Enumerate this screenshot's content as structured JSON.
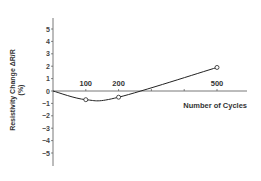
{
  "chart_data": {
    "type": "line",
    "title": "",
    "xlabel": "Number of Cycles",
    "ylabel": "Resistivity Change ΔR/R",
    "ylabel_unit": "(%)",
    "x_ticks": [
      100,
      200,
      500
    ],
    "x_ticks_unlabeled": [
      300,
      400
    ],
    "y_ticks": [
      5,
      4,
      3,
      2,
      1,
      0,
      -1,
      -2,
      -3,
      -4,
      -5
    ],
    "xlim": [
      0,
      600
    ],
    "ylim": [
      -6,
      6
    ],
    "grid": false,
    "legend": null,
    "series": [
      {
        "name": "Resistivity change",
        "marker": "open-circle",
        "x": [
          0,
          100,
          200,
          500
        ],
        "y": [
          0,
          -0.7,
          -0.5,
          1.9
        ],
        "marked_points": [
          1,
          2,
          3
        ]
      }
    ]
  }
}
